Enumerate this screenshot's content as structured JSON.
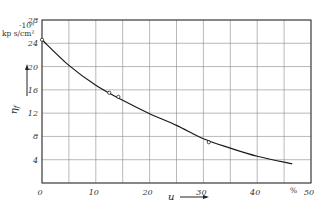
{
  "chart_data": {
    "type": "line",
    "title": "",
    "xlabel": "u",
    "xunit": "%",
    "ylabel": "η_f",
    "yunit": "kp s/cm²",
    "yscale_label": "·10⁸",
    "xlim": [
      0,
      50
    ],
    "ylim": [
      0,
      28
    ],
    "xticks": [
      0,
      10,
      20,
      30,
      40,
      50
    ],
    "yticks": [
      4,
      8,
      12,
      16,
      20,
      24,
      28
    ],
    "x_grid_step": 5,
    "y_grid_step": 4,
    "grid": true,
    "legend": null,
    "series": [
      {
        "name": "curve",
        "x": [
          0,
          5,
          10,
          15,
          20,
          25,
          30,
          35,
          40,
          46.5
        ],
        "y": [
          24.6,
          20.2,
          16.8,
          14.2,
          11.9,
          9.9,
          7.6,
          6.0,
          4.6,
          3.3
        ]
      },
      {
        "name": "measured points",
        "marker": "open-circle",
        "x": [
          0,
          12.5,
          14.2,
          31.0
        ],
        "y": [
          24.6,
          15.5,
          14.8,
          7.0
        ]
      }
    ]
  },
  "labels": {
    "y_unit_scale": "·10⁸",
    "y_unit": "kp s/cm²",
    "y_axis": "η",
    "y_axis_sub": "f",
    "x_axis": "u",
    "x_unit": "%"
  }
}
